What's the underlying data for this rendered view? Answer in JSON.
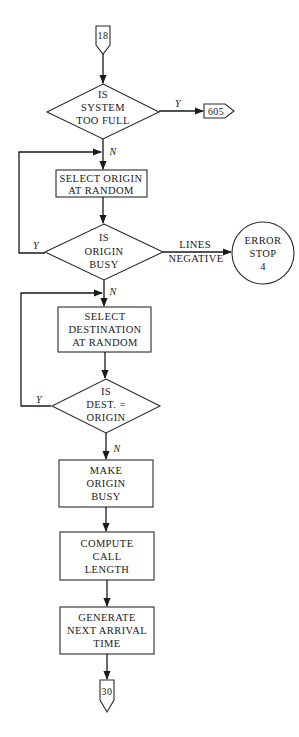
{
  "flowchart": {
    "entry_connector": {
      "label": "18",
      "shape": "offpage-connector"
    },
    "exit_connector": {
      "label": "30",
      "shape": "offpage-connector"
    },
    "side_connector": {
      "label": "605",
      "shape": "offpage-connector-right"
    },
    "nodes": [
      {
        "id": "d1",
        "type": "decision",
        "lines": [
          "IS",
          "SYSTEM",
          "TOO FULL"
        ]
      },
      {
        "id": "p1",
        "type": "process",
        "lines": [
          "SELECT ORIGIN",
          "AT RANDOM"
        ]
      },
      {
        "id": "d2",
        "type": "decision",
        "lines": [
          "IS",
          "ORIGIN",
          "BUSY"
        ]
      },
      {
        "id": "p2",
        "type": "process",
        "lines": [
          "SELECT",
          "DESTINATION",
          "AT RANDOM"
        ]
      },
      {
        "id": "d3",
        "type": "decision",
        "lines": [
          "IS",
          "DEST. =",
          "ORIGIN"
        ]
      },
      {
        "id": "p3",
        "type": "process",
        "lines": [
          "MAKE",
          "ORIGIN",
          "BUSY"
        ]
      },
      {
        "id": "p4",
        "type": "process",
        "lines": [
          "COMPUTE",
          "CALL",
          "LENGTH"
        ]
      },
      {
        "id": "p5",
        "type": "process",
        "lines": [
          "GENERATE",
          "NEXT ARRIVAL",
          "TIME"
        ]
      },
      {
        "id": "e1",
        "type": "terminal-circle",
        "lines": [
          "ERROR",
          "STOP",
          "4"
        ]
      }
    ],
    "edges": [
      {
        "from": "18",
        "to": "d1",
        "label": ""
      },
      {
        "from": "d1",
        "to": "605",
        "label": "Y"
      },
      {
        "from": "d1",
        "to": "p1",
        "label": "N"
      },
      {
        "from": "p1",
        "to": "d2",
        "label": ""
      },
      {
        "from": "d2",
        "to": "p1",
        "label": "Y"
      },
      {
        "from": "d2",
        "to": "e1",
        "label": "LINES NEGATIVE",
        "label_lines": [
          "LINES",
          "NEGATIVE"
        ]
      },
      {
        "from": "d2",
        "to": "p2",
        "label": "N"
      },
      {
        "from": "p2",
        "to": "d3",
        "label": ""
      },
      {
        "from": "d3",
        "to": "p2",
        "label": "Y"
      },
      {
        "from": "d3",
        "to": "p3",
        "label": "N"
      },
      {
        "from": "p3",
        "to": "p4",
        "label": ""
      },
      {
        "from": "p4",
        "to": "p5",
        "label": ""
      },
      {
        "from": "p5",
        "to": "30",
        "label": ""
      }
    ],
    "edge_labels": {
      "yes": "Y",
      "no": "N"
    },
    "colors": {
      "stroke": "#2a2a2a",
      "text": "#1a1a1a",
      "background": "#ffffff"
    }
  }
}
